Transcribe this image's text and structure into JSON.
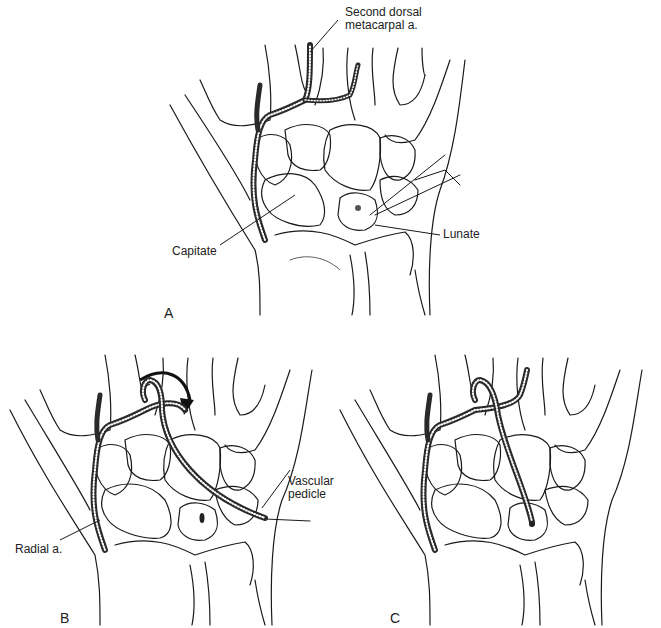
{
  "figure": {
    "panels": [
      {
        "id": "A",
        "letter": "A",
        "labels": {
          "artery_top": "Second dorsal",
          "artery_bottom": "metacarpal a.",
          "capitate": "Capitate",
          "lunate": "Lunate"
        }
      },
      {
        "id": "B",
        "letter": "B",
        "labels": {
          "pedicle_top": "Vascular",
          "pedicle_bottom": "pedicle",
          "radial": "Radial a."
        }
      },
      {
        "id": "C",
        "letter": "C",
        "labels": {}
      }
    ],
    "colors": {
      "line": "#1a1a1a",
      "artery": "#2a2a2a",
      "background": "#ffffff"
    }
  }
}
